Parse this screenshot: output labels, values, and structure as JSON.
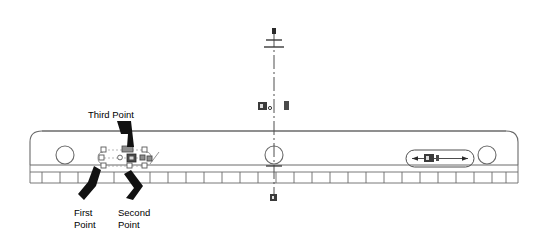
{
  "drawing": {
    "title": "CAD beam part view with selection grips",
    "background_color": "#ffffff",
    "line_color": "#5a5a5a",
    "annotation_color": "#000000",
    "grip_color": "#9a9a9a",
    "grip_hot_color": "#4a4a4a"
  },
  "annotations": {
    "third_point": "Third Point",
    "first_point_line1": "First",
    "first_point_line2": "Point",
    "second_point_line1": "Second",
    "second_point_line2": "Point"
  },
  "dimensions": {
    "slot_dim_label": "",
    "centerline_label": ""
  },
  "part": {
    "left_hole": "circle-hole-left",
    "center_hole": "circle-hole-center",
    "right_hole": "circle-hole-right",
    "rack_strip": "serrated-rack-strip"
  }
}
